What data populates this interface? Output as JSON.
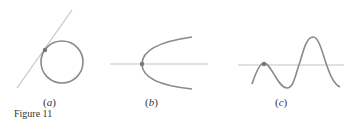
{
  "figure": {
    "caption": "Figure 11",
    "panels": [
      {
        "id": "a",
        "label_open": "(",
        "label_letter": "a",
        "label_close": ")",
        "description": "circle with tangent line touching at a point"
      },
      {
        "id": "b",
        "label_open": "(",
        "label_letter": "b",
        "label_close": ")",
        "description": "sideways parabola with horizontal axis line through its vertex"
      },
      {
        "id": "c",
        "label_open": "(",
        "label_letter": "c",
        "label_close": ")",
        "description": "wavy curve with horizontal line tangent at a local maximum"
      }
    ],
    "colors": {
      "curve": "#8a8a8a",
      "line": "#c4c4c4",
      "point": "#777777",
      "text": "#333333"
    }
  }
}
